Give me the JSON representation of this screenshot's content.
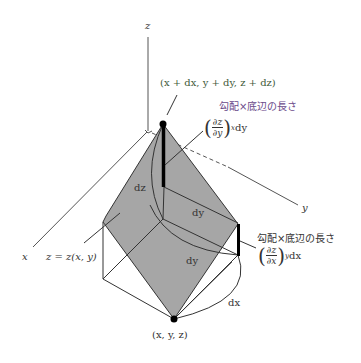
{
  "axes": {
    "z_label": "z",
    "x_label": "x",
    "y_label": "y"
  },
  "points": {
    "top": "(x + dx, y + dy, z + dz)",
    "bottom": "(x, y, z)"
  },
  "surface": {
    "label": "z = z(x, y)"
  },
  "edges": {
    "dz": "dz",
    "dy_upper": "dy",
    "dy_lower": "dy",
    "dx": "dx"
  },
  "annotations": {
    "upper": {
      "caption": "勾配×底辺の長さ",
      "numerator": "∂z",
      "denominator": "∂y",
      "subscript": "x",
      "factor": "dy"
    },
    "right": {
      "caption": "勾配×底辺の長さ",
      "numerator": "∂z",
      "denominator": "∂x",
      "subscript": "y",
      "factor": "dx"
    }
  },
  "colors": {
    "surface_fill": "#a6a6a6",
    "line": "#333333",
    "upper_annotation": "#5a7a4a",
    "upper_caption": "#6a4a8a",
    "text": "#333333"
  }
}
